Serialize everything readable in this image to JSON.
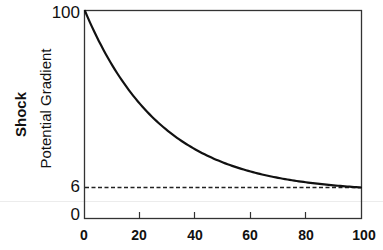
{
  "chart_data": {
    "type": "line",
    "title": "",
    "xlabel": "",
    "ylabel": "Shock Potential Gradient",
    "ylabel_lines": [
      "Shock",
      "Potential Gradient"
    ],
    "xlim": [
      0,
      100
    ],
    "ylim": [
      0,
      100
    ],
    "x_ticks": [
      "0",
      "20",
      "40",
      "60",
      "80",
      "100"
    ],
    "y_ticks": [
      "0",
      "6",
      "100"
    ],
    "grid": false,
    "legend": null,
    "series": [
      {
        "name": "Shock potential gradient",
        "style": "solid",
        "x": [
          0,
          5,
          10,
          15,
          20,
          30,
          40,
          50,
          60,
          70,
          80,
          90,
          100
        ],
        "y": [
          100,
          82,
          72,
          64,
          57,
          45,
          35,
          27,
          20,
          14,
          10,
          7,
          6
        ]
      },
      {
        "name": "Asymptote",
        "style": "dashed",
        "x": [
          0,
          100
        ],
        "y": [
          6,
          6
        ]
      }
    ],
    "annotations": []
  },
  "axis": {
    "y_label_line1": "Shock",
    "y_label_line2": "Potential Gradient",
    "y_tick_100": "100",
    "y_tick_6": "6",
    "y_tick_0": "0",
    "x_tick_0": "0",
    "x_tick_20": "20",
    "x_tick_40": "40",
    "x_tick_60": "60",
    "x_tick_80": "80",
    "x_tick_100": "100"
  },
  "colors": {
    "line": "#111111",
    "frame": "#333333",
    "background": "#ffffff"
  }
}
